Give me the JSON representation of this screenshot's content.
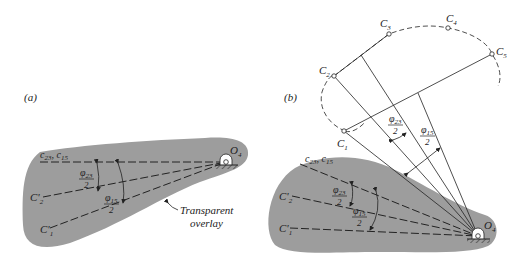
{
  "figure": {
    "panel_a": {
      "label": "(a)",
      "pivot": "O",
      "pivot_sub": "4",
      "lines": {
        "c_line": {
          "main": "c",
          "sub1": "23",
          "sep": ", ",
          "main2": "c",
          "sub2": "15"
        },
        "c2": {
          "main": "C'",
          "sub": "2"
        },
        "c1": {
          "main": "C'",
          "sub": "1"
        }
      },
      "angle_23": {
        "phi": "φ",
        "sub": "23",
        "den": "2"
      },
      "angle_15": {
        "phi": "φ",
        "sub": "15",
        "den": "2"
      },
      "callout": {
        "line1": "Transparent",
        "line2": "overlay"
      }
    },
    "panel_b": {
      "label": "(b)",
      "pivot": "O",
      "pivot_sub": "4",
      "points": [
        {
          "main": "C",
          "sub": "1"
        },
        {
          "main": "C",
          "sub": "2"
        },
        {
          "main": "C",
          "sub": "3"
        },
        {
          "main": "C",
          "sub": "4"
        },
        {
          "main": "C",
          "sub": "5"
        }
      ],
      "overlay_lines": {
        "c_line": {
          "main": "c",
          "sub1": "23",
          "sep": ", ",
          "main2": "c",
          "sub2": "15"
        },
        "c2": {
          "main": "C'",
          "sub": "2"
        },
        "c1": {
          "main": "C'",
          "sub": "1"
        }
      },
      "angle_23": {
        "phi": "φ",
        "sub": "23",
        "den": "2"
      },
      "angle_15": {
        "phi": "φ",
        "sub": "15",
        "den": "2"
      },
      "angle_23_top": {
        "phi": "φ",
        "sub": "23",
        "den": "2"
      },
      "angle_15_top": {
        "phi": "φ",
        "sub": "15",
        "den": "2"
      }
    },
    "colors": {
      "overlay": "#9d9d9d",
      "ink": "#222222",
      "background": "#ffffff"
    }
  }
}
